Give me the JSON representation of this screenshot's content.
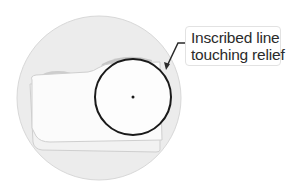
{
  "diagram": {
    "callout": {
      "line1": "Inscribed line",
      "line2": "touching relief"
    },
    "colors": {
      "magnifier_fill": "#eaeaea",
      "magnifier_stroke": "#d6d6d6",
      "body_fill": "#fbfbfb",
      "body_stroke": "#cfcfcf",
      "relief_fill": "#c8c8c8",
      "circle_stroke": "#1a1a1a",
      "leader_stroke": "#2a2a2a"
    }
  }
}
